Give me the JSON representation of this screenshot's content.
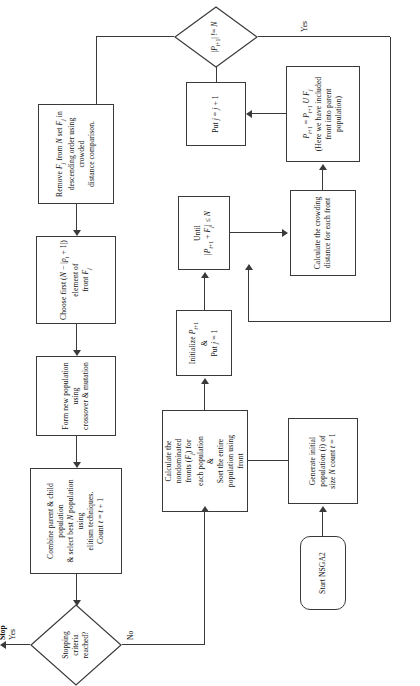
{
  "diagram": {
    "orientation": "rotated-90-ccw",
    "nodes": {
      "start": "Start NSGA2",
      "init_pop": "Generate initial population (i) of size N count t = 1",
      "calc_fronts": "Calculate the nondominated fronts (Fj) for each population & Sort the entire population using front",
      "initialize": "Initialize Pt+1 & Put j = 1",
      "until": "Until |Pt+1 + Fj| <= N",
      "crowding": "Calculate the crowding distance for each front",
      "union": "Pt+1 = Pt+1 U Fj (Here we have included front into parent population)",
      "put_j": "Put j = j + 1",
      "check_n": "|Pt+1| != N",
      "remove": "Remove Fj from N set Fj in descending order using crowded distance comparison.",
      "choose_first": "Choose first (N − |pt + 1|) element of front Fj",
      "form_new": "Form new population using crossover & mutation",
      "combine": "Combine parent & child population & select best N population using elitism techniques. Count t = t + 1",
      "stopping": "Stopping criteria reached?",
      "stop": "Stop"
    },
    "edge_labels": {
      "yes_stop": "Yes",
      "no": "No",
      "yes_loop": "Yes"
    },
    "colors": {
      "stroke": "#3a3a3a",
      "background": "#ffffff",
      "text": "#111111"
    }
  }
}
